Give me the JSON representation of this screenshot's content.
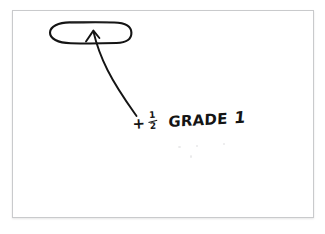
{
  "document": {
    "kind": "scanned-handwritten-note",
    "background_color": "#ffffff",
    "paper_color": "#ffffff",
    "paper_border_color": "#c9cacc",
    "ink_color": "#141414"
  },
  "annotation": {
    "note_full_text": "+1/2 GRADE 1",
    "plus_sign": "+",
    "fraction_numerator": "1",
    "fraction_denominator": "2",
    "grade_word": "GRADE",
    "grade_number": "1"
  },
  "marks": {
    "oval_name": "hand-drawn-oval",
    "arrow_name": "hand-drawn-curved-arrow",
    "arrow_direction": "points up-left into oval"
  }
}
